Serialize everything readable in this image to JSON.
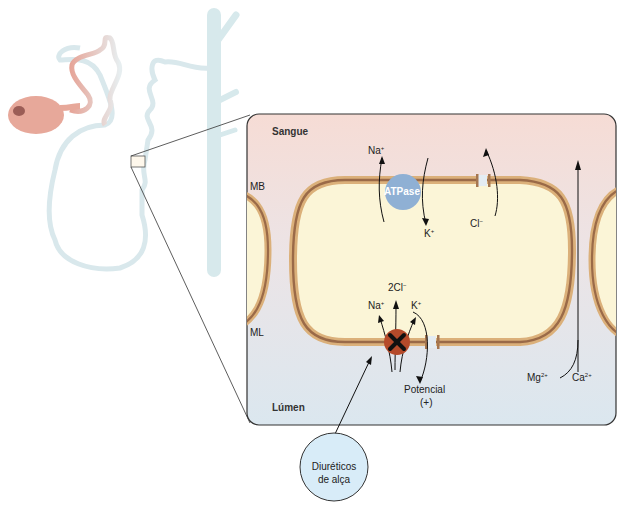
{
  "diagram": {
    "regions": {
      "blood": "Sangue",
      "lumen": "Lúmen",
      "basolateral_membrane": "MB",
      "luminal_membrane": "ML"
    },
    "pump": {
      "label": "ATPase"
    },
    "basolateral_ions": {
      "na": "Na",
      "na_charge": "+",
      "k": "K",
      "k_charge": "+",
      "cl": "Cl",
      "cl_charge": "−"
    },
    "luminal_ions": {
      "cl2": "2Cl",
      "cl2_charge": "−",
      "na": "Na",
      "na_charge": "+",
      "k": "K",
      "k_charge": "+"
    },
    "potential": {
      "line1": "Potencial",
      "line2": "(+)"
    },
    "paracellular": {
      "mg": "Mg",
      "mg_charge": "2+",
      "ca": "Ca",
      "ca_charge": "2+"
    },
    "drug_callout": {
      "line1": "Diuréticos",
      "line2": "de alça"
    },
    "colors": {
      "blood_bg": "#f5dcd6",
      "lumen_bg": "#dde8ef",
      "cell": "#fbf5d7",
      "membrane_outer": "#dbb07a",
      "membrane_inner": "#9a6a48",
      "atpase": "#8fb0d4",
      "cotransporter": "#b54a2a",
      "tubule": "#d6e9ee",
      "glomerulus": "#e7a89a",
      "callout": "#d8ecf8"
    }
  }
}
